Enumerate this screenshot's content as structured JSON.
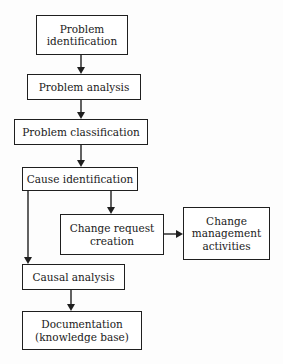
{
  "diagram": {
    "type": "flowchart",
    "nodes": {
      "problem_identification": {
        "label": "Problem\nidentification"
      },
      "problem_analysis": {
        "label": "Problem analysis"
      },
      "problem_classification": {
        "label": "Problem classification"
      },
      "cause_identification": {
        "label": "Cause identification"
      },
      "change_request_creation": {
        "label": "Change request\ncreation"
      },
      "change_management_activities": {
        "label": "Change\nmanagement\nactivities"
      },
      "causal_analysis": {
        "label": "Causal analysis"
      },
      "documentation": {
        "label": "Documentation\n(knowledge base)"
      }
    },
    "edges": [
      {
        "from": "problem_identification",
        "to": "problem_analysis"
      },
      {
        "from": "problem_analysis",
        "to": "problem_classification"
      },
      {
        "from": "problem_classification",
        "to": "cause_identification"
      },
      {
        "from": "cause_identification",
        "to": "change_request_creation"
      },
      {
        "from": "change_request_creation",
        "to": "change_management_activities"
      },
      {
        "from": "cause_identification",
        "to": "causal_analysis"
      },
      {
        "from": "causal_analysis",
        "to": "documentation"
      }
    ]
  }
}
